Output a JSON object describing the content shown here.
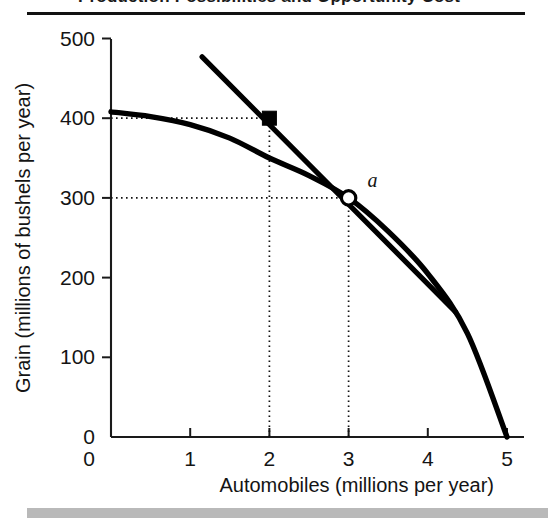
{
  "figure": {
    "caption_partial": "Production Possibilities and Opportunity Cost",
    "footer_label": ""
  },
  "chart_data": {
    "type": "line",
    "title": "",
    "xlabel": "Automobiles (millions per year)",
    "ylabel": "Grain (millions of bushels per year)",
    "xlim": [
      0,
      5.4
    ],
    "ylim": [
      0,
      520
    ],
    "xticks": [
      "0",
      "1",
      "2",
      "3",
      "4",
      "5"
    ],
    "xtick_values": [
      0,
      1,
      2,
      3,
      4,
      5
    ],
    "yticks": [
      "0",
      "100",
      "200",
      "300",
      "400",
      "500"
    ],
    "ytick_values": [
      0,
      100,
      200,
      300,
      400,
      500
    ],
    "grid": false,
    "legend": "none",
    "series": [
      {
        "name": "Production possibilities frontier",
        "type": "curve",
        "style": "solid-thick",
        "color": "#000000",
        "x": [
          0.0,
          0.5,
          1.0,
          1.5,
          2.0,
          2.5,
          3.0,
          3.5,
          4.0,
          4.5,
          5.0
        ],
        "y": [
          408,
          402,
          392,
          375,
          350,
          328,
          300,
          258,
          205,
          130,
          0
        ]
      },
      {
        "name": "Tangent line at point a",
        "type": "line",
        "style": "solid-thick",
        "color": "#000000",
        "x": [
          1.15,
          4.35
        ],
        "y": [
          477,
          157
        ],
        "slope": -100
      }
    ],
    "points": [
      {
        "name": "square-marker",
        "label": "",
        "x": 2,
        "y": 400,
        "marker": "filled-square",
        "color": "#000000",
        "on_series": "Tangent line at point a"
      },
      {
        "name": "point-a",
        "label": "a",
        "x": 3,
        "y": 300,
        "marker": "open-circle",
        "color": "#000000",
        "on_series": "Production possibilities frontier"
      }
    ],
    "annotations": [
      {
        "name": "guide-h-400",
        "type": "dotted-horizontal",
        "from_x": 0,
        "to_x": 2,
        "y": 400
      },
      {
        "name": "guide-v-2",
        "type": "dotted-vertical",
        "x": 2,
        "from_y": 0,
        "to_y": 400
      },
      {
        "name": "guide-h-300",
        "type": "dotted-horizontal",
        "from_x": 0,
        "to_x": 3,
        "y": 300
      },
      {
        "name": "guide-v-3",
        "type": "dotted-vertical",
        "x": 3,
        "from_y": 0,
        "to_y": 300
      }
    ]
  },
  "colors": {
    "ink": "#000000",
    "axis": "#1a1a1a",
    "paper": "#ffffff",
    "footer_strip": "#b9b9b9"
  }
}
